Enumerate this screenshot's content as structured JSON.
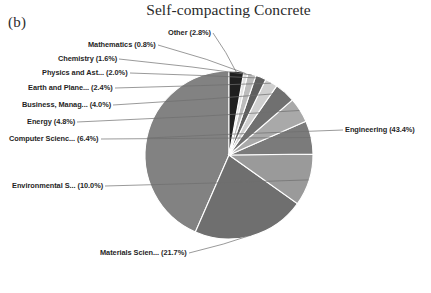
{
  "figure": {
    "panel_label": "(b)",
    "title": "Self-compacting Concrete"
  },
  "chart_data": {
    "type": "pie",
    "title": "Self-compacting Concrete",
    "xlabel": "",
    "ylabel": "",
    "legend_position": "none",
    "grid": false,
    "start_angle_deg": 90,
    "direction": "counterclockwise",
    "categories": [
      "Engineering",
      "Materials Scien...",
      "Environmental S...",
      "Computer Scienc...",
      "Energy",
      "Business, Manag...",
      "Earth and Plane...",
      "Physics and Ast...",
      "Chemistry",
      "Mathematics",
      "Other"
    ],
    "values": [
      43.4,
      21.7,
      10.0,
      6.4,
      4.8,
      4.0,
      2.4,
      2.0,
      1.6,
      0.8,
      2.8
    ],
    "units": "percent",
    "labels": [
      "Engineering (43.4%)",
      "Materials Scien... (21.7%)",
      "Environmental S... (10.0%)",
      "Computer Scienc... (6.4%)",
      "Energy (4.8%)",
      "Business, Manag... (4.0%)",
      "Earth and Plane... (2.4%)",
      "Physics and Ast... (2.0%)",
      "Chemistry (1.6%)",
      "Mathematics (0.8%)",
      "Other (2.8%)"
    ],
    "colors": [
      "#828282",
      "#6f6f6f",
      "#9a9a9a",
      "#7b7b7b",
      "#a9a9a9",
      "#707070",
      "#cfcfcf",
      "#5f5f5f",
      "#bcbcbc",
      "#e2e2e2",
      "#1f1f1f"
    ],
    "edge_color": "#ffffff"
  }
}
